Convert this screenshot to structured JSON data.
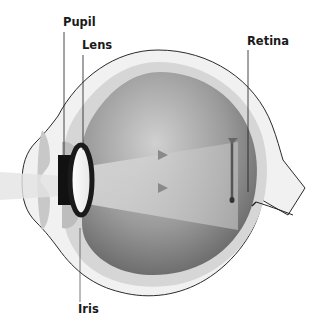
{
  "diagram": {
    "labels": {
      "pupil": "Pupil",
      "lens": "Lens",
      "retina": "Retina",
      "iris": "Iris"
    },
    "colors": {
      "outline": "#2a2a2a",
      "sclera": "#efefef",
      "choroid": "#d2d2d2",
      "vitreous_dark": "#6e6e6e",
      "vitreous_light": "#c8c8c8",
      "pupil": "#111111",
      "light_beam": "#bdbdbd"
    }
  }
}
